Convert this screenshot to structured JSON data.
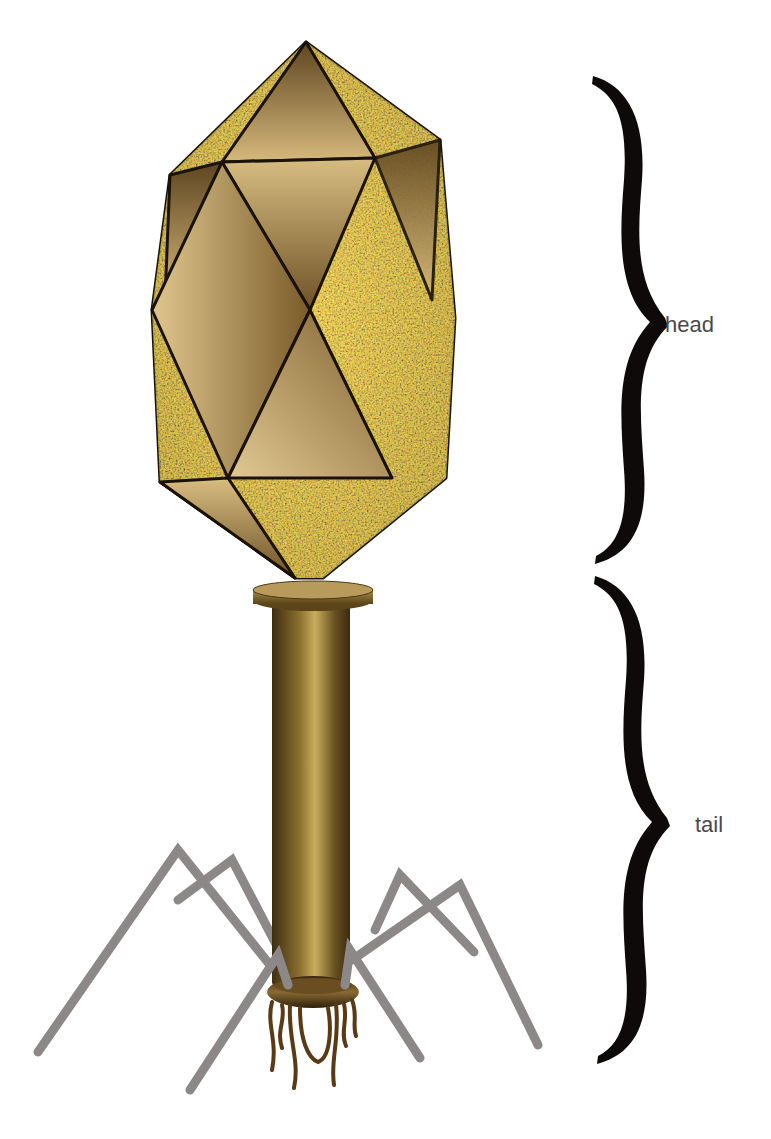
{
  "diagram": {
    "labels": [
      {
        "id": "head",
        "text": "head",
        "x": 665,
        "y": 312
      },
      {
        "id": "tail",
        "text": "tail",
        "x": 695,
        "y": 812
      }
    ],
    "braces": [
      {
        "id": "head-brace",
        "top": 78,
        "bottom": 562,
        "tip_y": 322
      },
      {
        "id": "tail-brace",
        "top": 578,
        "bottom": 1064,
        "tip_y": 822
      }
    ],
    "colors": {
      "capsid_face": "#c9a86a",
      "capsid_dark": "#6b5024",
      "capsid_edge": "#1a1208",
      "speckle_orange": "#e06a2a",
      "speckle_yellow": "#d8c040",
      "speckle_green": "#7aa040",
      "tail_sheath": "#8a6f2e",
      "tail_highlight": "#c6a95a",
      "tail_fiber": "#8c8888",
      "baseplate_fibers": "#5a3a14",
      "brace": "#0e0a0a",
      "label_text": "#4a4a4a"
    }
  }
}
